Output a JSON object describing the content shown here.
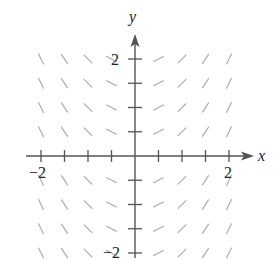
{
  "figure": {
    "type": "slope-field",
    "axes": {
      "x_label": "x",
      "y_label": "y",
      "x_range": [
        -2,
        2
      ],
      "y_range": [
        -2,
        2
      ],
      "tick_step": 0.5,
      "x_tick_labels": [
        {
          "value": -2,
          "text": "−2"
        },
        {
          "value": 2,
          "text": "2"
        }
      ],
      "y_tick_labels": [
        {
          "value": 2,
          "text": "2"
        },
        {
          "value": -2,
          "text": "−2"
        }
      ]
    },
    "slope_function": "dy/dx = x",
    "grid_x": [
      -2,
      -1.5,
      -1,
      -0.5,
      0.5,
      1,
      1.5,
      2
    ],
    "grid_y": [
      2,
      1.5,
      1,
      0.5,
      -0.5,
      -1,
      -1.5,
      -2
    ],
    "colors": {
      "axis": "#555555",
      "segment": "#a8a8a8",
      "label": "#222222"
    }
  }
}
